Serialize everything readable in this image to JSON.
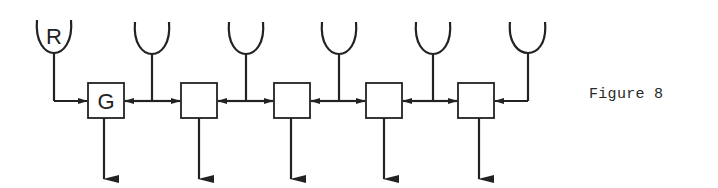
{
  "figure": {
    "caption": "Figure 8",
    "stroke_color": "#222222",
    "background": "#ffffff"
  },
  "diagram": {
    "cups": [
      {
        "label": "R",
        "cx": 54
      },
      {
        "label": "",
        "cx": 152
      },
      {
        "label": "",
        "cx": 246
      },
      {
        "label": "",
        "cx": 339
      },
      {
        "label": "",
        "cx": 433
      },
      {
        "label": "",
        "cx": 528
      }
    ],
    "boxes": [
      {
        "label": "G",
        "x": 88
      },
      {
        "label": "",
        "x": 181
      },
      {
        "label": "",
        "x": 274
      },
      {
        "label": "",
        "x": 366
      },
      {
        "label": "",
        "x": 458
      }
    ]
  }
}
